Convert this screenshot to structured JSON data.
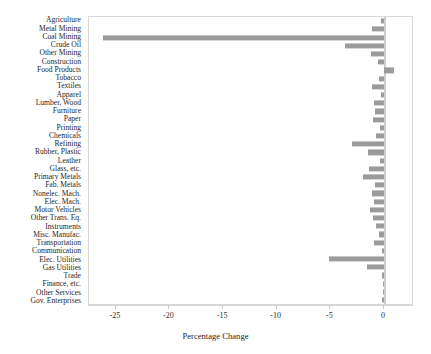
{
  "chart_data": {
    "type": "bar",
    "orientation": "horizontal",
    "title": "",
    "xlabel": "Percentage Change",
    "ylabel": "",
    "xlim": [
      -27.5,
      2.8
    ],
    "xticks": [
      -25,
      -20,
      -15,
      -10,
      -5,
      0
    ],
    "xtick_labels": [
      "-25",
      "-20",
      "-15",
      "-10",
      "-5",
      "0"
    ],
    "grid": false,
    "legend": null,
    "bar_color": "#9b9b9b",
    "frame_color": "#d8d8d8",
    "categories": [
      "Agriculture",
      "Metal Mining",
      "Coal Mining",
      "Crude Oil",
      "Other Mining",
      "Construction",
      "Food Products",
      "Tobacco",
      "Textiles",
      "Apparel",
      "Lumber, Wood",
      "Furniture",
      "Paper",
      "Printing",
      "Chemicals",
      "Refining",
      "Rubber, Plastic",
      "Leather",
      "Glass, etc.",
      "Primary Metals",
      "Fab. Metals",
      "Nonelec. Mach.",
      "Elec. Mach.",
      "Motor Vehicles",
      "Other Trans. Eq.",
      "Instruments",
      "Misc. Manufac.",
      "Transportation",
      "Communication",
      "Elec. Utilities",
      "Gas Utilities",
      "Trade",
      "Finance, etc.",
      "Other Services",
      "Gov. Enterprises"
    ],
    "values": [
      -0.3,
      -1.1,
      -26.2,
      -3.6,
      -1.2,
      -0.6,
      0.9,
      -0.5,
      -1.1,
      -0.3,
      -0.9,
      -0.8,
      -1.0,
      -0.4,
      -0.7,
      -3.0,
      -1.5,
      -0.4,
      -1.4,
      -2.0,
      -0.8,
      -1.1,
      -0.9,
      -1.3,
      -1.0,
      -0.7,
      -0.5,
      -0.9,
      -0.2,
      -5.1,
      -1.6,
      -0.2,
      -0.1,
      -0.1,
      -0.2
    ]
  }
}
